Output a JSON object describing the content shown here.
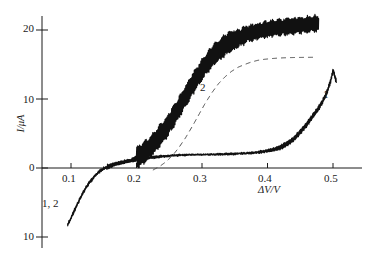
{
  "chart_data": {
    "type": "line",
    "title": "",
    "xlabel": "ΔV/V",
    "ylabel": "I/μA",
    "xlim": [
      0.06,
      0.53
    ],
    "ylim": [
      -11,
      23
    ],
    "grid": false,
    "legend_position": "inline-labels",
    "xticks": [
      0.1,
      0.2,
      0.3,
      0.4,
      0.5
    ],
    "xtick_labels": [
      "0.1",
      "0.2",
      "0.3",
      "0.4",
      "0.5"
    ],
    "yticks": [
      -10,
      0,
      10,
      20
    ],
    "ytick_labels": [
      "10",
      "0",
      "10",
      "20"
    ],
    "annotations": [
      {
        "text": "1, 2",
        "x": 0.105,
        "y": -5.2,
        "note": "shared onset branch label"
      },
      {
        "text": "2",
        "x": 0.27,
        "y": 11.5,
        "note": "upper rising curve"
      },
      {
        "text": "1",
        "x": 0.468,
        "y": 10.6,
        "note": "lower plateau curve"
      }
    ],
    "series": [
      {
        "name": "1",
        "style": "solid-noisy",
        "color": "#111111",
        "x": [
          0.095,
          0.1,
          0.105,
          0.11,
          0.115,
          0.12,
          0.125,
          0.13,
          0.135,
          0.14,
          0.145,
          0.15,
          0.155,
          0.16,
          0.165,
          0.17,
          0.175,
          0.18,
          0.185,
          0.19,
          0.195,
          0.2,
          0.205,
          0.21,
          0.215,
          0.22,
          0.23,
          0.24,
          0.25,
          0.26,
          0.27,
          0.28,
          0.29,
          0.3,
          0.31,
          0.32,
          0.33,
          0.34,
          0.35,
          0.36,
          0.37,
          0.38,
          0.39,
          0.4,
          0.41,
          0.42,
          0.43,
          0.44,
          0.45,
          0.458,
          0.465,
          0.472,
          0.478,
          0.484,
          0.489,
          0.493,
          0.497,
          0.5,
          0.503,
          0.505
        ],
        "y": [
          -8.2,
          -7.3,
          -6.2,
          -5.2,
          -4.2,
          -3.3,
          -2.5,
          -1.9,
          -1.3,
          -0.8,
          -0.4,
          -0.1,
          0.15,
          0.35,
          0.5,
          0.62,
          0.74,
          0.84,
          0.94,
          1.03,
          1.1,
          1.18,
          1.25,
          1.33,
          1.4,
          1.48,
          1.6,
          1.7,
          1.78,
          1.84,
          1.88,
          1.9,
          1.92,
          1.94,
          1.96,
          1.98,
          2.0,
          2.02,
          2.06,
          2.1,
          2.16,
          2.24,
          2.34,
          2.48,
          2.7,
          3.0,
          3.5,
          4.2,
          5.2,
          6.1,
          7.0,
          7.9,
          8.7,
          9.6,
          10.6,
          11.6,
          12.8,
          14.2,
          13.2,
          12.6
        ]
      },
      {
        "name": "2",
        "style": "solid-noisy-oscillating",
        "color": "#111111",
        "x": [
          0.095,
          0.1,
          0.105,
          0.11,
          0.115,
          0.12,
          0.125,
          0.13,
          0.135,
          0.14,
          0.145,
          0.15,
          0.155,
          0.16,
          0.165,
          0.17,
          0.175,
          0.18,
          0.185,
          0.19,
          0.195,
          0.2,
          0.205,
          0.21,
          0.215,
          0.22,
          0.225,
          0.23,
          0.235,
          0.24,
          0.245,
          0.25,
          0.255,
          0.26,
          0.265,
          0.27,
          0.275,
          0.28,
          0.285,
          0.29,
          0.295,
          0.3,
          0.305,
          0.31,
          0.315,
          0.32,
          0.33,
          0.34,
          0.35,
          0.36,
          0.37,
          0.38,
          0.39,
          0.4,
          0.41,
          0.42,
          0.43,
          0.44,
          0.45,
          0.46,
          0.47,
          0.478
        ],
        "y": [
          -8.2,
          -7.3,
          -6.2,
          -5.2,
          -4.2,
          -3.3,
          -2.5,
          -1.9,
          -1.3,
          -0.8,
          -0.4,
          -0.1,
          0.15,
          0.35,
          0.5,
          0.62,
          0.75,
          0.88,
          1.0,
          1.15,
          1.3,
          1.5,
          1.75,
          2.1,
          2.5,
          3.0,
          3.5,
          4.0,
          4.6,
          5.2,
          5.8,
          6.5,
          7.2,
          8.0,
          8.8,
          9.6,
          10.4,
          11.2,
          12.0,
          12.8,
          13.5,
          14.2,
          14.9,
          15.5,
          16.1,
          16.6,
          17.4,
          18.1,
          18.6,
          19.0,
          19.4,
          19.7,
          19.9,
          20.1,
          20.3,
          20.4,
          20.5,
          20.6,
          20.7,
          20.8,
          20.9,
          21.0
        ]
      },
      {
        "name": "theoretical",
        "style": "dashed",
        "color": "#4a4a4a",
        "x": [
          0.225,
          0.235,
          0.245,
          0.255,
          0.265,
          0.275,
          0.285,
          0.295,
          0.305,
          0.315,
          0.325,
          0.335,
          0.345,
          0.355,
          0.365,
          0.375,
          0.385,
          0.395,
          0.405,
          0.415,
          0.425,
          0.435,
          0.445,
          0.455,
          0.465,
          0.475
        ],
        "y": [
          -0.3,
          0.2,
          0.9,
          1.8,
          3.0,
          4.4,
          6.0,
          7.7,
          9.4,
          10.9,
          12.2,
          13.2,
          14.0,
          14.6,
          15.0,
          15.35,
          15.6,
          15.75,
          15.85,
          15.92,
          15.97,
          16.0,
          16.02,
          16.03,
          16.04,
          16.05
        ]
      }
    ]
  }
}
